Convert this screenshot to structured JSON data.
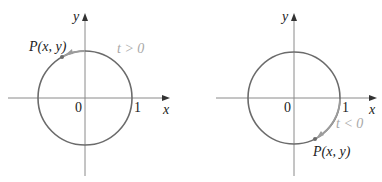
{
  "colors": {
    "axis": "#8a8a8a",
    "circle": "#6b6b6b",
    "param_arc": "#9c9c9c",
    "label": "#222222",
    "param_label": "#a8a8a8"
  },
  "panels": [
    {
      "id": "left",
      "y_axis_label": "y",
      "x_axis_label": "x",
      "origin_label": "0",
      "unit_label": "1",
      "point_label": "P(x, y)",
      "param_label": "t > 0",
      "direction": "counterclockwise"
    },
    {
      "id": "right",
      "y_axis_label": "y",
      "x_axis_label": "x",
      "origin_label": "0",
      "unit_label": "1",
      "point_label": "P(x, y)",
      "param_label": "t < 0",
      "direction": "clockwise"
    }
  ]
}
